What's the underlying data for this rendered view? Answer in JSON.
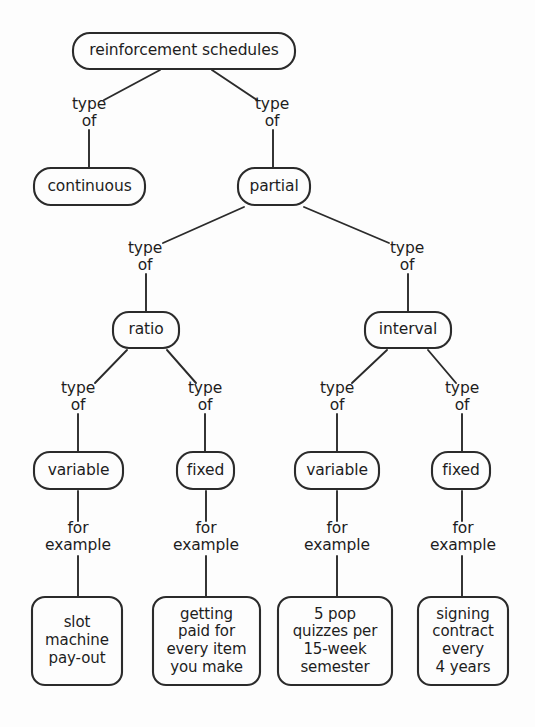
{
  "diagram": {
    "title": "reinforcement schedules",
    "type": "concept-map",
    "background_color": "#fdfdfd",
    "stroke_color": "#2b2b2b",
    "text_color": "#1d1d1d",
    "relation_labels": {
      "type_of": "type\nof",
      "for_example": "for\nexample"
    },
    "nodes": [
      {
        "id": "root",
        "label": "reinforcement schedules",
        "x": 73,
        "y": 33,
        "w": 222,
        "h": 36,
        "r": 17
      },
      {
        "id": "continuous",
        "label": "continuous",
        "x": 34,
        "y": 168,
        "w": 111,
        "h": 37,
        "r": 17
      },
      {
        "id": "partial",
        "label": "partial",
        "x": 238,
        "y": 168,
        "w": 72,
        "h": 37,
        "r": 17
      },
      {
        "id": "ratio",
        "label": "ratio",
        "x": 113,
        "y": 312,
        "w": 66,
        "h": 36,
        "r": 16
      },
      {
        "id": "interval",
        "label": "interval",
        "x": 365,
        "y": 312,
        "w": 86,
        "h": 36,
        "r": 16
      },
      {
        "id": "var_ratio",
        "label": "variable",
        "x": 34,
        "y": 452,
        "w": 89,
        "h": 37,
        "r": 16
      },
      {
        "id": "fix_ratio",
        "label": "fixed",
        "x": 177,
        "y": 452,
        "w": 57,
        "h": 37,
        "r": 16
      },
      {
        "id": "var_int",
        "label": "variable",
        "x": 295,
        "y": 452,
        "w": 84,
        "h": 37,
        "r": 16
      },
      {
        "id": "fix_int",
        "label": "fixed",
        "x": 432,
        "y": 452,
        "w": 58,
        "h": 37,
        "r": 16
      },
      {
        "id": "ex_slot",
        "label": "slot\nmachine\npay-out",
        "x": 32,
        "y": 597,
        "w": 90,
        "h": 88,
        "r": 13
      },
      {
        "id": "ex_paid",
        "label": "getting\npaid for\nevery item\nyou make",
        "x": 153,
        "y": 597,
        "w": 107,
        "h": 88,
        "r": 13
      },
      {
        "id": "ex_quiz",
        "label": "5 pop\nquizzes per\n15-week\nsemester",
        "x": 278,
        "y": 597,
        "w": 114,
        "h": 88,
        "r": 13
      },
      {
        "id": "ex_sign",
        "label": "signing\ncontract\nevery\n4 years",
        "x": 418,
        "y": 597,
        "w": 90,
        "h": 88,
        "r": 13
      }
    ],
    "edge_labels": [
      {
        "id": "lbl-root-continuous",
        "text": "type\nof",
        "cx": 89,
        "y": 96
      },
      {
        "id": "lbl-root-partial",
        "text": "type\nof",
        "cx": 272,
        "y": 96
      },
      {
        "id": "lbl-partial-ratio",
        "text": "type\nof",
        "cx": 145,
        "y": 240
      },
      {
        "id": "lbl-partial-interval",
        "text": "type\nof",
        "cx": 407,
        "y": 240
      },
      {
        "id": "lbl-ratio-variable",
        "text": "type\nof",
        "cx": 78,
        "y": 380
      },
      {
        "id": "lbl-ratio-fixed",
        "text": "type\nof",
        "cx": 205,
        "y": 380
      },
      {
        "id": "lbl-interval-variable",
        "text": "type\nof",
        "cx": 337,
        "y": 380
      },
      {
        "id": "lbl-interval-fixed",
        "text": "type\nof",
        "cx": 462,
        "y": 380
      },
      {
        "id": "lbl-varratio-ex",
        "text": "for\nexample",
        "cx": 78,
        "y": 520
      },
      {
        "id": "lbl-fixratio-ex",
        "text": "for\nexample",
        "cx": 206,
        "y": 520
      },
      {
        "id": "lbl-varint-ex",
        "text": "for\nexample",
        "cx": 337,
        "y": 520
      },
      {
        "id": "lbl-fixint-ex",
        "text": "for\nexample",
        "cx": 463,
        "y": 520
      }
    ],
    "edges": [
      {
        "id": "e-root-continuous-diag",
        "from": "root",
        "to": "lbl-root-continuous",
        "x1": 160,
        "y1": 70,
        "x2": 104,
        "y2": 100
      },
      {
        "id": "e-root-continuous-stem",
        "from": "lbl",
        "to": "continuous",
        "x1": 89,
        "y1": 130,
        "x2": 89,
        "y2": 168
      },
      {
        "id": "e-root-partial-diag",
        "from": "root",
        "to": "lbl-root-partial",
        "x1": 212,
        "y1": 70,
        "x2": 257,
        "y2": 100
      },
      {
        "id": "e-root-partial-stem",
        "from": "lbl",
        "to": "partial",
        "x1": 273,
        "y1": 130,
        "x2": 273,
        "y2": 168
      },
      {
        "id": "e-partial-ratio-diag",
        "from": "partial",
        "to": "lbl-partial-ratio",
        "x1": 244,
        "y1": 207,
        "x2": 163,
        "y2": 243
      },
      {
        "id": "e-partial-ratio-stem",
        "from": "lbl",
        "to": "ratio",
        "x1": 146,
        "y1": 274,
        "x2": 146,
        "y2": 312
      },
      {
        "id": "e-partial-interval-diag",
        "from": "partial",
        "to": "lbl-partial-interval",
        "x1": 304,
        "y1": 207,
        "x2": 389,
        "y2": 243
      },
      {
        "id": "e-partial-interval-stem",
        "from": "lbl",
        "to": "interval",
        "x1": 408,
        "y1": 274,
        "x2": 408,
        "y2": 312
      },
      {
        "id": "e-ratio-var-diag",
        "from": "ratio",
        "to": "lbl-ratio-variable",
        "x1": 127,
        "y1": 350,
        "x2": 95,
        "y2": 383
      },
      {
        "id": "e-ratio-var-stem",
        "from": "lbl",
        "to": "var_ratio",
        "x1": 78,
        "y1": 414,
        "x2": 78,
        "y2": 452
      },
      {
        "id": "e-ratio-fix-diag",
        "from": "ratio",
        "to": "lbl-ratio-fixed",
        "x1": 167,
        "y1": 350,
        "x2": 196,
        "y2": 383
      },
      {
        "id": "e-ratio-fix-stem",
        "from": "lbl",
        "to": "fix_ratio",
        "x1": 205,
        "y1": 414,
        "x2": 205,
        "y2": 452
      },
      {
        "id": "e-int-var-diag",
        "from": "interval",
        "to": "lbl-interval-variable",
        "x1": 387,
        "y1": 350,
        "x2": 352,
        "y2": 383
      },
      {
        "id": "e-int-var-stem",
        "from": "lbl",
        "to": "var_int",
        "x1": 337,
        "y1": 414,
        "x2": 337,
        "y2": 452
      },
      {
        "id": "e-int-fix-diag",
        "from": "interval",
        "to": "lbl-interval-fixed",
        "x1": 428,
        "y1": 350,
        "x2": 456,
        "y2": 383
      },
      {
        "id": "e-int-fix-stem",
        "from": "lbl",
        "to": "fix_int",
        "x1": 462,
        "y1": 414,
        "x2": 462,
        "y2": 452
      },
      {
        "id": "e-varratio-lbl",
        "from": "var_ratio",
        "to": "lbl-varratio-ex",
        "x1": 78,
        "y1": 491,
        "x2": 78,
        "y2": 521
      },
      {
        "id": "e-varratio-ex",
        "from": "lbl",
        "to": "ex_slot",
        "x1": 78,
        "y1": 556,
        "x2": 78,
        "y2": 597
      },
      {
        "id": "e-fixratio-lbl",
        "from": "fix_ratio",
        "to": "lbl-fixratio-ex",
        "x1": 206,
        "y1": 491,
        "x2": 206,
        "y2": 521
      },
      {
        "id": "e-fixratio-ex",
        "from": "lbl",
        "to": "ex_paid",
        "x1": 206,
        "y1": 556,
        "x2": 206,
        "y2": 597
      },
      {
        "id": "e-varint-lbl",
        "from": "var_int",
        "to": "lbl-varint-ex",
        "x1": 337,
        "y1": 491,
        "x2": 337,
        "y2": 521
      },
      {
        "id": "e-varint-ex",
        "from": "lbl",
        "to": "ex_quiz",
        "x1": 337,
        "y1": 556,
        "x2": 337,
        "y2": 597
      },
      {
        "id": "e-fixint-lbl",
        "from": "fix_int",
        "to": "lbl-fixint-ex",
        "x1": 462,
        "y1": 491,
        "x2": 462,
        "y2": 521
      },
      {
        "id": "e-fixint-ex",
        "from": "lbl",
        "to": "ex_sign",
        "x1": 462,
        "y1": 556,
        "x2": 462,
        "y2": 597
      }
    ]
  }
}
